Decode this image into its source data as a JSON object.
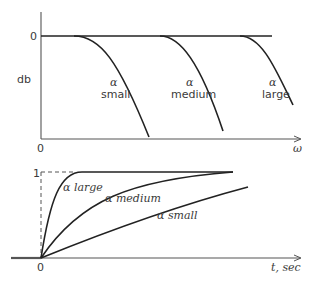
{
  "top_plot": {
    "y_axis_label": "db",
    "y_zero_label": "0",
    "x_origin_label": "0",
    "x_axis_label": "ω",
    "curves": [
      {
        "alpha": "α",
        "label": "small"
      },
      {
        "alpha": "α",
        "label": "medium"
      },
      {
        "alpha": "α",
        "label": "large"
      }
    ]
  },
  "bottom_plot": {
    "y_one_label": "1",
    "x_origin_label": "0",
    "x_axis_label": "t, sec",
    "curves": [
      {
        "label": "α large"
      },
      {
        "label": "α medium"
      },
      {
        "label": "α small"
      }
    ]
  },
  "colors": {
    "curve": "#222222",
    "axis": "#555555",
    "text": "#3a3a3a",
    "background": "#ffffff"
  }
}
